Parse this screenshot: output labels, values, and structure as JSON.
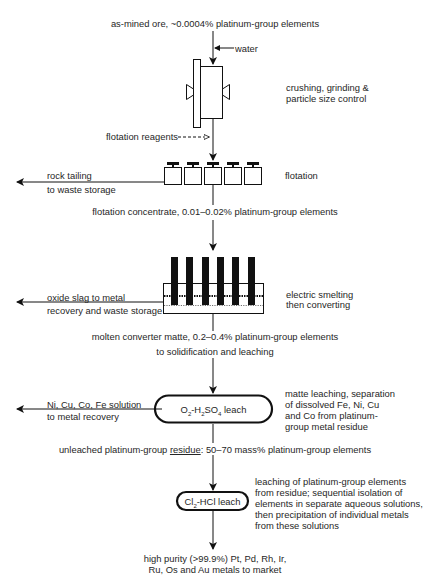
{
  "diagram": {
    "type": "process-flow",
    "main_stream": [
      {
        "id": "ore",
        "label": "as-mined ore, ~0.0004% platinum-group elements"
      },
      {
        "id": "flot_conc",
        "label": "flotation concentrate, 0.01–0.02% platinum-group elements"
      },
      {
        "id": "matte_line1",
        "label": "molten converter matte, 0.2–0.4% platinum-group elements"
      },
      {
        "id": "matte_line2",
        "label": "to solidification and leaching"
      },
      {
        "id": "residue_prefix",
        "label": "unleached platinum-group "
      },
      {
        "id": "residue_word",
        "label": "residue"
      },
      {
        "id": "residue_suffix",
        "label": ": 50–70 mass% platinum-group elements"
      },
      {
        "id": "product_line1",
        "label": "high purity (>99.9%) Pt, Pd, Rh, Ir,"
      },
      {
        "id": "product_line2",
        "label": "Ru, Os and Au metals to market"
      }
    ],
    "inputs": {
      "water": "water",
      "flotation_reagents": "flotation reagents"
    },
    "units": [
      {
        "id": "crushing",
        "desc_lines": [
          "crushing, grinding &",
          "particle size control"
        ]
      },
      {
        "id": "flotation",
        "desc_lines": [
          "flotation"
        ]
      },
      {
        "id": "smelting",
        "desc_lines": [
          "electric smelting",
          "then converting"
        ]
      },
      {
        "id": "matte_leach",
        "box_label_parts": [
          "O",
          "2",
          "-H",
          "2",
          "SO",
          "4",
          " leach"
        ],
        "desc_lines": [
          "matte leaching, separation",
          "of dissolved Fe, Ni, Cu",
          "and Co from platinum-",
          "group metal residue"
        ]
      },
      {
        "id": "pgm_leach",
        "box_label_parts": [
          "Cl",
          "2",
          "-HCl leach"
        ],
        "desc_lines": [
          "leaching of platinum-group elements",
          "from residue; sequential isolation of",
          "elements in separate aqueous solutions,",
          "then precipitation of individual metals",
          "from these solutions"
        ]
      }
    ],
    "side_streams": [
      {
        "id": "rock_tailing",
        "lines": [
          "rock tailing",
          "to waste storage"
        ]
      },
      {
        "id": "oxide_slag",
        "lines": [
          "oxide slag to metal",
          "recovery and waste storage"
        ]
      },
      {
        "id": "ni_cu_solution",
        "lines": [
          "Ni, Cu, Co, Fe solution",
          "to metal recovery"
        ]
      }
    ]
  }
}
